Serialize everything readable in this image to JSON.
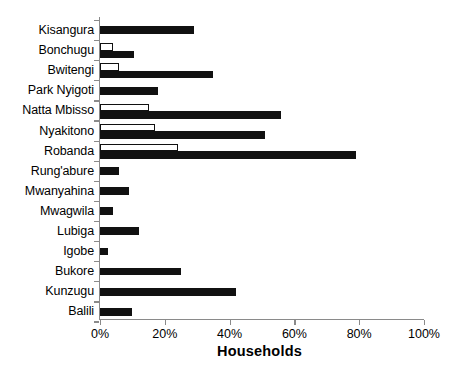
{
  "chart_data": {
    "type": "bar",
    "orientation": "horizontal",
    "title": "",
    "xlabel": "Households",
    "ylabel": "",
    "xlim": [
      0,
      100
    ],
    "xunit": "%",
    "grid": false,
    "legend": null,
    "xticks": [
      "0%",
      "20%",
      "40%",
      "60%",
      "80%",
      "100%"
    ],
    "xtickvalues": [
      0,
      20,
      40,
      60,
      80,
      100
    ],
    "categories": [
      "Kisangura",
      "Bonchugu",
      "Bwitengi",
      "Park Nyigoti",
      "Natta Mbisso",
      "Nyakitono",
      "Robanda",
      "Rung'abure",
      "Mwanyahina",
      "Mwagwila",
      "Lubiga",
      "Igobe",
      "Bukore",
      "Kunzugu",
      "Balili"
    ],
    "series": [
      {
        "name": "white-series",
        "style": "hollow-white",
        "color": "#ffffff",
        "edgecolor": "#111111",
        "values": [
          0,
          4,
          6,
          0,
          15,
          17,
          24,
          0,
          0,
          0,
          0,
          0,
          0,
          0,
          0
        ]
      },
      {
        "name": "black-series",
        "style": "filled-black",
        "color": "#111111",
        "edgecolor": "#111111",
        "values": [
          29,
          10.5,
          35,
          18,
          56,
          51,
          79,
          6,
          9,
          4,
          12,
          2.5,
          25,
          42,
          10
        ]
      }
    ]
  }
}
